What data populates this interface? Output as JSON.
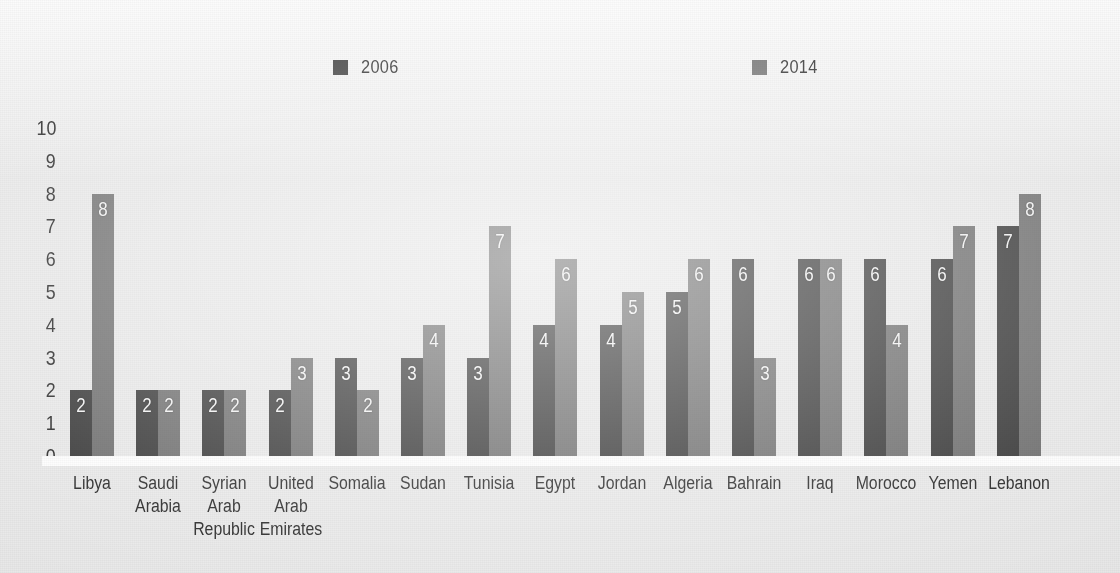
{
  "chart_data": {
    "type": "bar",
    "title": "",
    "subtitle": "",
    "xlabel": "",
    "ylabel": "",
    "ylim": [
      0,
      10
    ],
    "ytick_labels": [
      "10",
      "9",
      "8",
      "7",
      "6",
      "5",
      "4",
      "3",
      "2",
      "1",
      "0"
    ],
    "grid": false,
    "legend_position": "top",
    "categories": [
      "Libya",
      "Saudi Arabia",
      "Syrian Arab Republic",
      "United Arab Emirates",
      "Somalia",
      "Sudan",
      "Tunisia",
      "Egypt",
      "Jordan",
      "Algeria",
      "Bahrain",
      "Iraq",
      "Morocco",
      "Yemen",
      "Lebanon"
    ],
    "category_lines": [
      [
        "Libya"
      ],
      [
        "Saudi",
        "Arabia"
      ],
      [
        "Syrian",
        "Arab",
        "Republic"
      ],
      [
        "United",
        "Arab",
        "Emirates"
      ],
      [
        "Somalia"
      ],
      [
        "Sudan"
      ],
      [
        "Tunisia"
      ],
      [
        "Egypt"
      ],
      [
        "Jordan"
      ],
      [
        "Algeria"
      ],
      [
        "Bahrain"
      ],
      [
        "Iraq"
      ],
      [
        "Morocco"
      ],
      [
        "Yemen"
      ],
      [
        "Lebanon"
      ]
    ],
    "series": [
      {
        "name": "2006",
        "color": "#3a3a3a",
        "values": [
          2,
          2,
          2,
          2,
          3,
          3,
          3,
          4,
          4,
          5,
          6,
          6,
          6,
          6,
          7
        ]
      },
      {
        "name": "2014",
        "color": "#707070",
        "values": [
          8,
          2,
          2,
          3,
          2,
          4,
          7,
          6,
          5,
          6,
          3,
          6,
          4,
          7,
          8
        ]
      }
    ]
  },
  "legend": {
    "entries": [
      {
        "label": "2006",
        "color": "#3a3a3a"
      },
      {
        "label": "2014",
        "color": "#707070"
      }
    ]
  }
}
